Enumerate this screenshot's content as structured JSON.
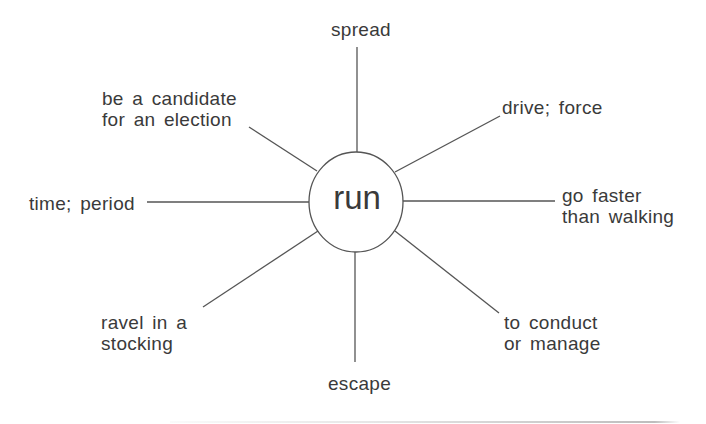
{
  "diagram": {
    "center": "run",
    "meanings": {
      "top": "spread",
      "top_right": "drive; force",
      "right": [
        "go faster",
        "than walking"
      ],
      "bottom_right": [
        "to conduct",
        "or manage"
      ],
      "bottom": "escape",
      "bottom_left": [
        "ravel in a",
        "stocking"
      ],
      "left": "time; period",
      "top_left": [
        "be a candidate",
        "for an election"
      ]
    },
    "colors": {
      "line": "#555555",
      "text": "#3a3a3a",
      "background": "#ffffff"
    }
  }
}
